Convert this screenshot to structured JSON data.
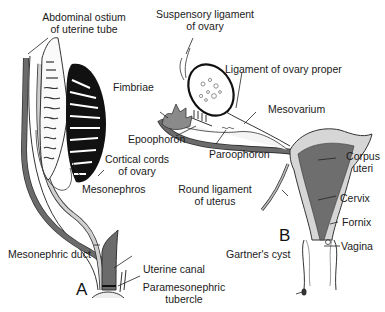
{
  "figure": {
    "panels": [
      {
        "id": "A",
        "letter": "A"
      },
      {
        "id": "B",
        "letter": "B"
      }
    ],
    "colors": {
      "duct_dark": "#6b6b6b",
      "duct_light": "#cfcfcf",
      "uterus_fill": "#6e6e6e",
      "wall_fill": "#d6d6d6",
      "ovary_black": "#111111",
      "outline": "#222222"
    }
  },
  "labels": {
    "abdominal_ostium_1": "Abdominal ostium",
    "abdominal_ostium_2": "of uterine tube",
    "cortical_cords_1": "Cortical cords",
    "cortical_cords_2": "of ovary",
    "mesonephros": "Mesonephros",
    "mesonephric_duct": "Mesonephric duct",
    "uterine_canal": "Uterine canal",
    "paramesonephric_1": "Paramesonephric",
    "paramesonephric_2": "tubercle",
    "suspensory_1": "Suspensory ligament",
    "suspensory_2": "of ovary",
    "ligament_ovary_proper": "Ligament of ovary proper",
    "fimbriae": "Fimbriae",
    "mesovarium": "Mesovarium",
    "epoophoron": "Epoophoron",
    "paroophoron": "Paroophoron",
    "round_ligament_1": "Round ligament",
    "round_ligament_2": "of uterus",
    "corpus_1": "Corpus",
    "corpus_2": "uteri",
    "cervix": "Cervix",
    "fornix": "Fornix",
    "vagina": "Vagina",
    "gartners_cyst": "Gartner's cyst"
  }
}
